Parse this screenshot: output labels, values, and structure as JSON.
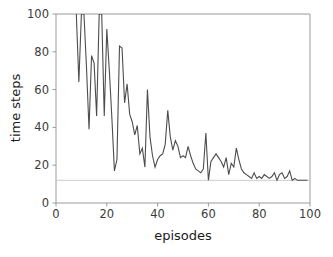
{
  "chart_data": {
    "type": "line",
    "title": "",
    "xlabel": "episodes",
    "ylabel": "time steps",
    "xlim": [
      0,
      100
    ],
    "ylim": [
      0,
      100
    ],
    "xticks": [
      0,
      20,
      40,
      60,
      80,
      100
    ],
    "yticks": [
      0,
      20,
      40,
      60,
      80,
      100
    ],
    "xtick_labels": [
      "0",
      "20",
      "40",
      "60",
      "80",
      "100"
    ],
    "ytick_labels": [
      "0",
      "20",
      "40",
      "60",
      "80",
      "100"
    ],
    "grid": false,
    "legend": null,
    "line_color": "#4d4d4d",
    "line_width": 1.1,
    "background_color": "#ffffff",
    "spine_color": "#9a9a9a",
    "reference_line": {
      "name": "optimal-baseline",
      "orientation": "horizontal",
      "y": 12,
      "color": "#cccccc",
      "style": "solid"
    },
    "series": [
      {
        "name": "time steps per episode",
        "color": "#4d4d4d",
        "x": [
          8,
          9,
          10,
          11,
          12,
          13,
          14,
          15,
          16,
          17,
          18,
          19,
          20,
          21,
          22,
          23,
          24,
          25,
          26,
          27,
          28,
          29,
          30,
          31,
          32,
          33,
          34,
          35,
          36,
          37,
          38,
          39,
          40,
          41,
          42,
          43,
          44,
          45,
          46,
          47,
          48,
          49,
          50,
          51,
          52,
          53,
          54,
          55,
          56,
          57,
          58,
          59,
          60,
          61,
          62,
          63,
          64,
          65,
          66,
          67,
          68,
          69,
          70,
          71,
          72,
          73,
          74,
          75,
          76,
          77,
          78,
          79,
          80,
          81,
          82,
          83,
          84,
          85,
          86,
          87,
          88,
          89,
          90,
          91,
          92,
          93,
          94,
          95,
          96,
          97,
          98,
          99
        ],
        "y": [
          100,
          64,
          100,
          100,
          72,
          39,
          78,
          74,
          46,
          100,
          100,
          46,
          92,
          70,
          45,
          17,
          23,
          83,
          82,
          53,
          63,
          47,
          43,
          36,
          41,
          26,
          29,
          19,
          60,
          35,
          25,
          19,
          23,
          25,
          26,
          31,
          49,
          35,
          28,
          33,
          30,
          24,
          25,
          24,
          30,
          25,
          21,
          18,
          17,
          16,
          18,
          37,
          12,
          22,
          24,
          26,
          24,
          22,
          19,
          24,
          15,
          21,
          19,
          29,
          23,
          18,
          16,
          15,
          14,
          13,
          16,
          13,
          14,
          13,
          15,
          14,
          13,
          14,
          16,
          12,
          15,
          16,
          13,
          14,
          17,
          12,
          13,
          12,
          12,
          12,
          12,
          12
        ]
      }
    ]
  },
  "axes": {
    "xlabel": "episodes",
    "ylabel": "time steps"
  }
}
